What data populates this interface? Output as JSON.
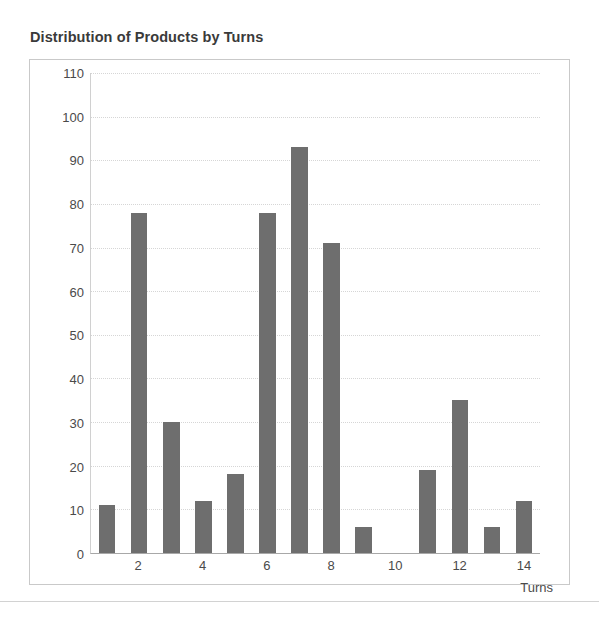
{
  "chart_data": {
    "type": "bar",
    "title": "Distribution of Products by Turns",
    "xlabel": "Turns",
    "ylabel": "",
    "categories": [
      1,
      2,
      3,
      4,
      5,
      6,
      7,
      8,
      9,
      10,
      11,
      12,
      13,
      14
    ],
    "values": [
      11,
      78,
      30,
      12,
      18,
      78,
      93,
      71,
      6,
      0,
      19,
      35,
      6,
      12
    ],
    "xtick_labels": [
      "",
      "2",
      "",
      "4",
      "",
      "6",
      "",
      "8",
      "",
      "10",
      "",
      "12",
      "",
      "14"
    ],
    "ylim": [
      0,
      110
    ],
    "ytick_labels": [
      "110",
      "100",
      "90",
      "80",
      "70",
      "60",
      "50",
      "40",
      "30",
      "20",
      "10",
      "0"
    ],
    "ytick_values": [
      110,
      100,
      90,
      80,
      70,
      60,
      50,
      40,
      30,
      20,
      10,
      0
    ],
    "grid": true,
    "legend": false,
    "bar_color": "#6e6e6e",
    "plot_background": "#ffffff",
    "gridline_color": "#d6d6d6",
    "border_color": "#c9c9c9"
  }
}
